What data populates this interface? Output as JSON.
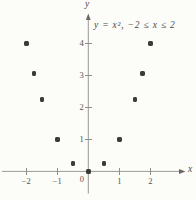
{
  "figure": {
    "equation": "y = x², −2 ≤ x ≤ 2",
    "x_axis_label": "x",
    "y_axis_label": "y",
    "origin_label": "0"
  },
  "chart_data": {
    "type": "scatter",
    "title": "y = x², −2 ≤ x ≤ 2",
    "xlabel": "x",
    "ylabel": "y",
    "xlim": [
      -2.8,
      3.1
    ],
    "ylim": [
      -0.9,
      4.9
    ],
    "grid": false,
    "legend": false,
    "x_ticks": [
      -2,
      -1,
      1,
      2
    ],
    "x_tick_labels": [
      "−2",
      "−1",
      "1",
      "2"
    ],
    "y_ticks": [
      1,
      2,
      3,
      4
    ],
    "y_tick_labels": [
      "1",
      "2",
      "3",
      "4"
    ],
    "points": [
      {
        "x": -2,
        "y": 4
      },
      {
        "x": -1.75,
        "y": 3.0625
      },
      {
        "x": -1.5,
        "y": 2.25
      },
      {
        "x": -1,
        "y": 1
      },
      {
        "x": -0.5,
        "y": 0.25
      },
      {
        "x": 0,
        "y": 0
      },
      {
        "x": 0.5,
        "y": 0.25
      },
      {
        "x": 1,
        "y": 1
      },
      {
        "x": 1.5,
        "y": 2.25
      },
      {
        "x": 1.75,
        "y": 3.0625
      },
      {
        "x": 2,
        "y": 4
      }
    ],
    "point_color": "#3b3b3b",
    "axis_color": "#908e89",
    "text_color": "#55534f",
    "background_color": "#fcfcf9"
  }
}
